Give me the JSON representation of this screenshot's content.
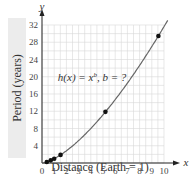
{
  "chart_data": {
    "type": "scatter",
    "title": "",
    "xlabel": "Distance (Earth = 1)",
    "ylabel": "Period (years)",
    "x_axis_name": "x",
    "y_axis_name": "y",
    "xlim": [
      0,
      10
    ],
    "ylim": [
      0,
      32
    ],
    "x_ticks": [
      0,
      1,
      2,
      3,
      4,
      5,
      6,
      7,
      8,
      9,
      10
    ],
    "y_ticks": [
      4,
      8,
      12,
      16,
      20,
      24,
      28,
      32
    ],
    "grid": true,
    "annotation": "h(x) = x^b, b = ?",
    "series": [
      {
        "name": "planets",
        "x": [
          0.39,
          0.72,
          1.0,
          1.52,
          5.2,
          9.54
        ],
        "y": [
          0.24,
          0.62,
          1.0,
          1.88,
          11.86,
          29.46
        ]
      }
    ],
    "curve": {
      "name": "h(x)",
      "exponent": 1.5
    }
  },
  "labels": {
    "ylabel": "Period (years)",
    "xlabel": "Distance (Earth = 1)",
    "annotation_h": "h(x) = x",
    "annotation_b_sup": "b",
    "annotation_tail": ", b = ?"
  }
}
